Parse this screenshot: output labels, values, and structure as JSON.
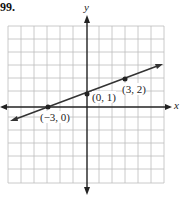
{
  "problem_number": "99.",
  "axes": {
    "x_label": "x",
    "y_label": "y"
  },
  "grid": {
    "cols": 12,
    "rows": 12,
    "x_min": -6,
    "x_max": 6,
    "y_min": -6,
    "y_max": 6
  },
  "line": {
    "slope": "1/3",
    "intercept": 1,
    "color": "#333333"
  },
  "points": [
    {
      "label": "(−3, 0)",
      "x": -3,
      "y": 0
    },
    {
      "label": "(0, 1)",
      "x": 0,
      "y": 1
    },
    {
      "label": "(3, 2)",
      "x": 3,
      "y": 2
    }
  ]
}
